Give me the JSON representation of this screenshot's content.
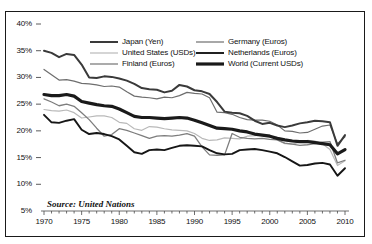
{
  "chart_data": {
    "type": "line",
    "title": "",
    "xlabel": "",
    "ylabel": "",
    "xlim": [
      1970,
      2010
    ],
    "ylim": [
      5,
      40
    ],
    "ytick_labels": [
      "40%",
      "35%",
      "30%",
      "25%",
      "20%",
      "15%",
      "10%",
      "5%"
    ],
    "ytick_values": [
      40,
      35,
      30,
      25,
      20,
      15,
      10,
      5
    ],
    "xtick_labels": [
      "1970",
      "1975",
      "1980",
      "1985",
      "1990",
      "1995",
      "2000",
      "2005",
      "2010"
    ],
    "xtick_values": [
      1970,
      1975,
      1980,
      1985,
      1990,
      1995,
      2000,
      2005,
      2010
    ],
    "minor_xticks": "every year",
    "grid": false,
    "legend_position": "top-center",
    "annotation": "Source: United Nations",
    "x": [
      1970,
      1971,
      1972,
      1973,
      1974,
      1975,
      1976,
      1977,
      1978,
      1979,
      1980,
      1981,
      1982,
      1983,
      1984,
      1985,
      1986,
      1987,
      1988,
      1989,
      1990,
      1991,
      1992,
      1993,
      1994,
      1995,
      1996,
      1997,
      1998,
      1999,
      2000,
      2001,
      2002,
      2003,
      2004,
      2005,
      2006,
      2007,
      2008,
      2009,
      2010
    ],
    "series": [
      {
        "name": "Japan (Yen)",
        "label": "Japan (Yen)",
        "color": "#3a3a3a",
        "width": 2.0,
        "values": [
          35.0,
          34.6,
          33.8,
          34.4,
          34.2,
          32.4,
          30.0,
          29.9,
          30.2,
          30.1,
          29.8,
          29.4,
          28.8,
          28.0,
          27.8,
          27.7,
          27.2,
          27.5,
          28.6,
          28.3,
          27.6,
          27.4,
          26.9,
          25.4,
          23.6,
          23.4,
          23.3,
          22.8,
          21.9,
          21.3,
          21.5,
          21.0,
          20.7,
          21.0,
          21.4,
          21.6,
          21.9,
          21.8,
          21.6,
          17.2,
          19.2
        ]
      },
      {
        "name": "Germany (Euros)",
        "label": "Germany (Euros)",
        "color": "#6e6e6e",
        "width": 1.2,
        "values": [
          31.5,
          30.5,
          29.5,
          29.6,
          29.3,
          28.9,
          28.8,
          28.6,
          28.3,
          28.4,
          28.2,
          27.3,
          26.5,
          26.3,
          26.2,
          26.0,
          26.3,
          26.2,
          26.6,
          27.2,
          27.0,
          26.9,
          26.2,
          23.5,
          23.4,
          23.1,
          22.5,
          22.1,
          22.0,
          22.0,
          21.8,
          21.1,
          20.0,
          19.9,
          19.6,
          19.7,
          20.3,
          20.9,
          21.1,
          17.6,
          18.9
        ]
      },
      {
        "name": "World (Current USDs)",
        "label": "World (Current USDs)",
        "color": "#1a1a1a",
        "width": 3.2,
        "values": [
          26.8,
          26.6,
          26.6,
          26.8,
          26.5,
          25.5,
          25.2,
          24.9,
          24.7,
          24.6,
          24.1,
          23.4,
          22.7,
          22.5,
          22.5,
          22.4,
          22.3,
          22.4,
          22.5,
          22.4,
          22.0,
          21.5,
          21.0,
          20.5,
          20.4,
          20.3,
          20.0,
          19.8,
          19.4,
          19.2,
          19.0,
          18.6,
          18.3,
          18.1,
          18.0,
          18.0,
          17.8,
          17.6,
          17.4,
          15.7,
          16.5
        ]
      },
      {
        "name": "Finland (Euros)",
        "label": "Finland (Euros)",
        "color": "#7d7d7d",
        "width": 1.3,
        "values": [
          26.0,
          25.4,
          24.7,
          25.0,
          24.6,
          23.4,
          22.1,
          20.5,
          19.0,
          19.3,
          20.4,
          20.1,
          19.6,
          19.1,
          18.6,
          19.0,
          19.1,
          19.0,
          19.2,
          19.5,
          19.0,
          17.0,
          15.5,
          15.4,
          15.5,
          19.5,
          18.8,
          18.6,
          18.5,
          18.6,
          18.4,
          18.3,
          17.7,
          17.5,
          17.3,
          17.4,
          17.6,
          17.9,
          18.0,
          14.0,
          14.5
        ]
      },
      {
        "name": "United States (USDs)",
        "label": "United States (USDs)",
        "color": "#b9b9b9",
        "width": 1.2,
        "values": [
          24.0,
          23.8,
          23.7,
          23.9,
          23.4,
          22.4,
          22.6,
          22.8,
          22.8,
          22.5,
          21.6,
          21.4,
          20.4,
          20.1,
          20.8,
          20.7,
          20.4,
          20.2,
          20.1,
          20.0,
          19.5,
          18.6,
          18.2,
          18.3,
          18.7,
          18.6,
          18.5,
          19.0,
          19.1,
          19.2,
          19.2,
          18.3,
          17.6,
          17.5,
          17.9,
          18.2,
          18.1,
          17.6,
          16.5,
          13.5,
          14.4
        ]
      },
      {
        "name": "Netherlands (Euros)",
        "label": "Netherlands (Euros)",
        "color": "#161616",
        "width": 1.9,
        "values": [
          23.0,
          21.6,
          21.5,
          21.9,
          22.2,
          20.2,
          19.4,
          19.6,
          19.4,
          19.0,
          18.4,
          17.2,
          16.0,
          15.7,
          16.4,
          16.5,
          16.4,
          16.8,
          17.2,
          17.3,
          17.2,
          17.1,
          16.4,
          15.8,
          15.6,
          15.7,
          16.4,
          16.5,
          16.6,
          16.4,
          16.1,
          15.8,
          15.1,
          14.3,
          13.5,
          13.6,
          13.9,
          14.0,
          13.7,
          11.6,
          13.0
        ]
      }
    ],
    "legend_items": [
      {
        "label": "Japan (Yen)",
        "color": "#3a3a3a",
        "width": 2.0,
        "col": 0,
        "row": 0
      },
      {
        "label": "United States (USDs)",
        "color": "#b9b9b9",
        "width": 1.2,
        "col": 0,
        "row": 1
      },
      {
        "label": "Finland (Euros)",
        "color": "#7d7d7d",
        "width": 1.3,
        "col": 0,
        "row": 2
      },
      {
        "label": "Germany (Euros)",
        "color": "#6e6e6e",
        "width": 1.2,
        "col": 1,
        "row": 0
      },
      {
        "label": "Netherlands (Euros)",
        "color": "#161616",
        "width": 1.9,
        "col": 1,
        "row": 1
      },
      {
        "label": "World (Current USDs)",
        "color": "#1a1a1a",
        "width": 3.2,
        "col": 1,
        "row": 2
      }
    ]
  }
}
